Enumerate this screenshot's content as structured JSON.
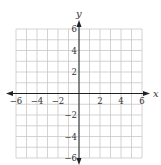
{
  "chart_data": {
    "type": "scatter",
    "title": "",
    "xlabel": "x",
    "ylabel": "y",
    "xlim": [
      -6,
      6
    ],
    "ylim": [
      -6,
      6
    ],
    "grid": true,
    "grid_step": 1,
    "x_ticks": [
      -6,
      -4,
      -2,
      2,
      4,
      6
    ],
    "y_ticks": [
      6,
      4,
      2,
      -2,
      -4,
      -6
    ],
    "x_tick_labels": [
      "−6",
      "−4",
      "−2",
      "2",
      "4",
      "6"
    ],
    "y_tick_labels": [
      "6",
      "4",
      "2",
      "−2",
      "−4",
      "−6"
    ],
    "series": []
  },
  "colors": {
    "grid": "#c8c8c8",
    "axis": "#222222",
    "text": "#333333"
  }
}
